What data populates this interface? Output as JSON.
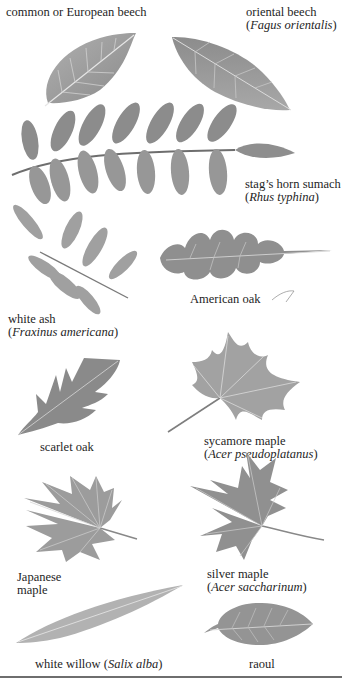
{
  "page": {
    "background": "#ffffff",
    "ink_color": "#1e1e1e",
    "leaf_fill": "#9a9a9a",
    "leaf_dark": "#7a7a7a",
    "leaf_vein": "#d8d8d8"
  },
  "leaves": [
    {
      "id": "common-beech",
      "label": "common or European beech",
      "latin": ""
    },
    {
      "id": "oriental-beech",
      "label": "oriental beech",
      "latin_open": "(",
      "latin": "Fagus orientalis",
      "latin_close": ")"
    },
    {
      "id": "stags-horn-sumach",
      "label": "stag’s horn sumach",
      "latin_open": "(",
      "latin": "Rhus typhina",
      "latin_close": ")"
    },
    {
      "id": "white-ash",
      "label": "white ash",
      "latin_open": "(",
      "latin": "Fraxinus americana",
      "latin_close": ")"
    },
    {
      "id": "american-oak",
      "label": "American oak",
      "latin": ""
    },
    {
      "id": "scarlet-oak",
      "label": "scarlet oak",
      "latin": ""
    },
    {
      "id": "sycamore-maple",
      "label": "sycamore maple",
      "latin_open": "(",
      "latin": "Acer pseudoplatanus",
      "latin_close": ")"
    },
    {
      "id": "japanese-maple",
      "label_line1": "Japanese",
      "label_line2": "maple",
      "latin": ""
    },
    {
      "id": "silver-maple",
      "label": "silver maple",
      "latin_open": "(",
      "latin": "Acer saccharinum",
      "latin_close": ")"
    },
    {
      "id": "white-willow",
      "label": "white willow (",
      "latin": "Salix alba",
      "latin_close": ")"
    },
    {
      "id": "raoul",
      "label": "raoul",
      "latin": ""
    }
  ]
}
